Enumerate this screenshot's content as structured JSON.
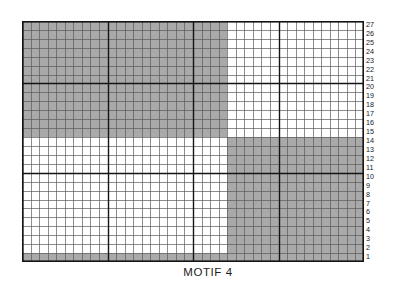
{
  "caption": {
    "text": "MOTIF 4"
  },
  "chart_data": {
    "type": "heatmap",
    "title": "MOTIF 4",
    "xlabel": "",
    "ylabel": "",
    "columns": 40,
    "rows": 27,
    "row_labels": [
      "27",
      "26",
      "25",
      "24",
      "23",
      "22",
      "21",
      "20",
      "19",
      "18",
      "17",
      "16",
      "15",
      "14",
      "13",
      "12",
      "11",
      "10",
      "9",
      "8",
      "7",
      "6",
      "5",
      "4",
      "3",
      "2",
      "1"
    ],
    "column_labels": [],
    "legend": [
      {
        "label": "filled",
        "value": 1,
        "color": "#a9a9a9"
      },
      {
        "label": "empty",
        "value": 0,
        "color": "#ffffff"
      }
    ],
    "grid": true,
    "heavy_line_interval": 10,
    "blocks": [
      {
        "name": "top-left-filled",
        "col_start": 1,
        "col_end": 24,
        "row_start": 15,
        "row_end": 27,
        "value": 1
      },
      {
        "name": "top-right-empty",
        "col_start": 25,
        "col_end": 40,
        "row_start": 15,
        "row_end": 27,
        "value": 0
      },
      {
        "name": "bottom-left-empty",
        "col_start": 1,
        "col_end": 24,
        "row_start": 2,
        "row_end": 14,
        "value": 0
      },
      {
        "name": "bottom-right-filled",
        "col_start": 25,
        "col_end": 40,
        "row_start": 2,
        "row_end": 14,
        "value": 1
      },
      {
        "name": "base-row-filled",
        "col_start": 1,
        "col_end": 40,
        "row_start": 1,
        "row_end": 1,
        "value": 1
      }
    ],
    "rows_top_to_bottom": [
      {
        "row": 27,
        "cells": [
          1,
          1,
          1,
          1,
          1,
          1,
          1,
          1,
          1,
          1,
          1,
          1,
          1,
          1,
          1,
          1,
          1,
          1,
          1,
          1,
          1,
          1,
          1,
          1,
          0,
          0,
          0,
          0,
          0,
          0,
          0,
          0,
          0,
          0,
          0,
          0,
          0,
          0,
          0,
          0
        ]
      },
      {
        "row": 26,
        "cells": [
          1,
          1,
          1,
          1,
          1,
          1,
          1,
          1,
          1,
          1,
          1,
          1,
          1,
          1,
          1,
          1,
          1,
          1,
          1,
          1,
          1,
          1,
          1,
          1,
          0,
          0,
          0,
          0,
          0,
          0,
          0,
          0,
          0,
          0,
          0,
          0,
          0,
          0,
          0,
          0
        ]
      },
      {
        "row": 25,
        "cells": [
          1,
          1,
          1,
          1,
          1,
          1,
          1,
          1,
          1,
          1,
          1,
          1,
          1,
          1,
          1,
          1,
          1,
          1,
          1,
          1,
          1,
          1,
          1,
          1,
          0,
          0,
          0,
          0,
          0,
          0,
          0,
          0,
          0,
          0,
          0,
          0,
          0,
          0,
          0,
          0
        ]
      },
      {
        "row": 24,
        "cells": [
          1,
          1,
          1,
          1,
          1,
          1,
          1,
          1,
          1,
          1,
          1,
          1,
          1,
          1,
          1,
          1,
          1,
          1,
          1,
          1,
          1,
          1,
          1,
          1,
          0,
          0,
          0,
          0,
          0,
          0,
          0,
          0,
          0,
          0,
          0,
          0,
          0,
          0,
          0,
          0
        ]
      },
      {
        "row": 23,
        "cells": [
          1,
          1,
          1,
          1,
          1,
          1,
          1,
          1,
          1,
          1,
          1,
          1,
          1,
          1,
          1,
          1,
          1,
          1,
          1,
          1,
          1,
          1,
          1,
          1,
          0,
          0,
          0,
          0,
          0,
          0,
          0,
          0,
          0,
          0,
          0,
          0,
          0,
          0,
          0,
          0
        ]
      },
      {
        "row": 22,
        "cells": [
          1,
          1,
          1,
          1,
          1,
          1,
          1,
          1,
          1,
          1,
          1,
          1,
          1,
          1,
          1,
          1,
          1,
          1,
          1,
          1,
          1,
          1,
          1,
          1,
          0,
          0,
          0,
          0,
          0,
          0,
          0,
          0,
          0,
          0,
          0,
          0,
          0,
          0,
          0,
          0
        ]
      },
      {
        "row": 21,
        "cells": [
          1,
          1,
          1,
          1,
          1,
          1,
          1,
          1,
          1,
          1,
          1,
          1,
          1,
          1,
          1,
          1,
          1,
          1,
          1,
          1,
          1,
          1,
          1,
          1,
          0,
          0,
          0,
          0,
          0,
          0,
          0,
          0,
          0,
          0,
          0,
          0,
          0,
          0,
          0,
          0
        ]
      },
      {
        "row": 20,
        "cells": [
          1,
          1,
          1,
          1,
          1,
          1,
          1,
          1,
          1,
          1,
          1,
          1,
          1,
          1,
          1,
          1,
          1,
          1,
          1,
          1,
          1,
          1,
          1,
          1,
          0,
          0,
          0,
          0,
          0,
          0,
          0,
          0,
          0,
          0,
          0,
          0,
          0,
          0,
          0,
          0
        ]
      },
      {
        "row": 19,
        "cells": [
          1,
          1,
          1,
          1,
          1,
          1,
          1,
          1,
          1,
          1,
          1,
          1,
          1,
          1,
          1,
          1,
          1,
          1,
          1,
          1,
          1,
          1,
          1,
          1,
          0,
          0,
          0,
          0,
          0,
          0,
          0,
          0,
          0,
          0,
          0,
          0,
          0,
          0,
          0,
          0
        ]
      },
      {
        "row": 18,
        "cells": [
          1,
          1,
          1,
          1,
          1,
          1,
          1,
          1,
          1,
          1,
          1,
          1,
          1,
          1,
          1,
          1,
          1,
          1,
          1,
          1,
          1,
          1,
          1,
          1,
          0,
          0,
          0,
          0,
          0,
          0,
          0,
          0,
          0,
          0,
          0,
          0,
          0,
          0,
          0,
          0
        ]
      },
      {
        "row": 17,
        "cells": [
          1,
          1,
          1,
          1,
          1,
          1,
          1,
          1,
          1,
          1,
          1,
          1,
          1,
          1,
          1,
          1,
          1,
          1,
          1,
          1,
          1,
          1,
          1,
          1,
          0,
          0,
          0,
          0,
          0,
          0,
          0,
          0,
          0,
          0,
          0,
          0,
          0,
          0,
          0,
          0
        ]
      },
      {
        "row": 16,
        "cells": [
          1,
          1,
          1,
          1,
          1,
          1,
          1,
          1,
          1,
          1,
          1,
          1,
          1,
          1,
          1,
          1,
          1,
          1,
          1,
          1,
          1,
          1,
          1,
          1,
          0,
          0,
          0,
          0,
          0,
          0,
          0,
          0,
          0,
          0,
          0,
          0,
          0,
          0,
          0,
          0
        ]
      },
      {
        "row": 15,
        "cells": [
          1,
          1,
          1,
          1,
          1,
          1,
          1,
          1,
          1,
          1,
          1,
          1,
          1,
          1,
          1,
          1,
          1,
          1,
          1,
          1,
          1,
          1,
          1,
          1,
          0,
          0,
          0,
          0,
          0,
          0,
          0,
          0,
          0,
          0,
          0,
          0,
          0,
          0,
          0,
          0
        ]
      },
      {
        "row": 14,
        "cells": [
          0,
          0,
          0,
          0,
          0,
          0,
          0,
          0,
          0,
          0,
          0,
          0,
          0,
          0,
          0,
          0,
          0,
          0,
          0,
          0,
          0,
          0,
          0,
          0,
          1,
          1,
          1,
          1,
          1,
          1,
          1,
          1,
          1,
          1,
          1,
          1,
          1,
          1,
          1,
          1
        ]
      },
      {
        "row": 13,
        "cells": [
          0,
          0,
          0,
          0,
          0,
          0,
          0,
          0,
          0,
          0,
          0,
          0,
          0,
          0,
          0,
          0,
          0,
          0,
          0,
          0,
          0,
          0,
          0,
          0,
          1,
          1,
          1,
          1,
          1,
          1,
          1,
          1,
          1,
          1,
          1,
          1,
          1,
          1,
          1,
          1
        ]
      },
      {
        "row": 12,
        "cells": [
          0,
          0,
          0,
          0,
          0,
          0,
          0,
          0,
          0,
          0,
          0,
          0,
          0,
          0,
          0,
          0,
          0,
          0,
          0,
          0,
          0,
          0,
          0,
          0,
          1,
          1,
          1,
          1,
          1,
          1,
          1,
          1,
          1,
          1,
          1,
          1,
          1,
          1,
          1,
          1
        ]
      },
      {
        "row": 11,
        "cells": [
          0,
          0,
          0,
          0,
          0,
          0,
          0,
          0,
          0,
          0,
          0,
          0,
          0,
          0,
          0,
          0,
          0,
          0,
          0,
          0,
          0,
          0,
          0,
          0,
          1,
          1,
          1,
          1,
          1,
          1,
          1,
          1,
          1,
          1,
          1,
          1,
          1,
          1,
          1,
          1
        ]
      },
      {
        "row": 10,
        "cells": [
          0,
          0,
          0,
          0,
          0,
          0,
          0,
          0,
          0,
          0,
          0,
          0,
          0,
          0,
          0,
          0,
          0,
          0,
          0,
          0,
          0,
          0,
          0,
          0,
          1,
          1,
          1,
          1,
          1,
          1,
          1,
          1,
          1,
          1,
          1,
          1,
          1,
          1,
          1,
          1
        ]
      },
      {
        "row": 9,
        "cells": [
          0,
          0,
          0,
          0,
          0,
          0,
          0,
          0,
          0,
          0,
          0,
          0,
          0,
          0,
          0,
          0,
          0,
          0,
          0,
          0,
          0,
          0,
          0,
          0,
          1,
          1,
          1,
          1,
          1,
          1,
          1,
          1,
          1,
          1,
          1,
          1,
          1,
          1,
          1,
          1
        ]
      },
      {
        "row": 8,
        "cells": [
          0,
          0,
          0,
          0,
          0,
          0,
          0,
          0,
          0,
          0,
          0,
          0,
          0,
          0,
          0,
          0,
          0,
          0,
          0,
          0,
          0,
          0,
          0,
          0,
          1,
          1,
          1,
          1,
          1,
          1,
          1,
          1,
          1,
          1,
          1,
          1,
          1,
          1,
          1,
          1
        ]
      },
      {
        "row": 7,
        "cells": [
          0,
          0,
          0,
          0,
          0,
          0,
          0,
          0,
          0,
          0,
          0,
          0,
          0,
          0,
          0,
          0,
          0,
          0,
          0,
          0,
          0,
          0,
          0,
          0,
          1,
          1,
          1,
          1,
          1,
          1,
          1,
          1,
          1,
          1,
          1,
          1,
          1,
          1,
          1,
          1
        ]
      },
      {
        "row": 6,
        "cells": [
          0,
          0,
          0,
          0,
          0,
          0,
          0,
          0,
          0,
          0,
          0,
          0,
          0,
          0,
          0,
          0,
          0,
          0,
          0,
          0,
          0,
          0,
          0,
          0,
          1,
          1,
          1,
          1,
          1,
          1,
          1,
          1,
          1,
          1,
          1,
          1,
          1,
          1,
          1,
          1
        ]
      },
      {
        "row": 5,
        "cells": [
          0,
          0,
          0,
          0,
          0,
          0,
          0,
          0,
          0,
          0,
          0,
          0,
          0,
          0,
          0,
          0,
          0,
          0,
          0,
          0,
          0,
          0,
          0,
          0,
          1,
          1,
          1,
          1,
          1,
          1,
          1,
          1,
          1,
          1,
          1,
          1,
          1,
          1,
          1,
          1
        ]
      },
      {
        "row": 4,
        "cells": [
          0,
          0,
          0,
          0,
          0,
          0,
          0,
          0,
          0,
          0,
          0,
          0,
          0,
          0,
          0,
          0,
          0,
          0,
          0,
          0,
          0,
          0,
          0,
          0,
          1,
          1,
          1,
          1,
          1,
          1,
          1,
          1,
          1,
          1,
          1,
          1,
          1,
          1,
          1,
          1
        ]
      },
      {
        "row": 3,
        "cells": [
          0,
          0,
          0,
          0,
          0,
          0,
          0,
          0,
          0,
          0,
          0,
          0,
          0,
          0,
          0,
          0,
          0,
          0,
          0,
          0,
          0,
          0,
          0,
          0,
          1,
          1,
          1,
          1,
          1,
          1,
          1,
          1,
          1,
          1,
          1,
          1,
          1,
          1,
          1,
          1
        ]
      },
      {
        "row": 2,
        "cells": [
          0,
          0,
          0,
          0,
          0,
          0,
          0,
          0,
          0,
          0,
          0,
          0,
          0,
          0,
          0,
          0,
          0,
          0,
          0,
          0,
          0,
          0,
          0,
          0,
          1,
          1,
          1,
          1,
          1,
          1,
          1,
          1,
          1,
          1,
          1,
          1,
          1,
          1,
          1,
          1
        ]
      },
      {
        "row": 1,
        "cells": [
          1,
          1,
          1,
          1,
          1,
          1,
          1,
          1,
          1,
          1,
          1,
          1,
          1,
          1,
          1,
          1,
          1,
          1,
          1,
          1,
          1,
          1,
          1,
          1,
          1,
          1,
          1,
          1,
          1,
          1,
          1,
          1,
          1,
          1,
          1,
          1,
          1,
          1,
          1,
          1
        ]
      }
    ]
  },
  "colors": {
    "fill": "#a9a9a9",
    "empty": "#ffffff",
    "thin_line": "#5a5a5a",
    "heavy_line": "#141414",
    "border": "#141414",
    "text": "#1a1a1a"
  }
}
